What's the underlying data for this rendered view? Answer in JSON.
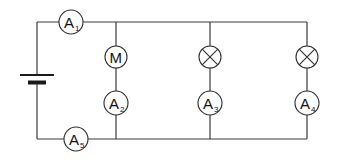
{
  "diagram": {
    "colors": {
      "wire": "#3a3a3a",
      "symbol": "#2e2e2e",
      "background": "#ffffff"
    },
    "battery": {
      "label": "battery",
      "x": 37,
      "long_plate_y": 75,
      "short_plate_y": 82
    },
    "components": {
      "A1": {
        "type": "ammeter",
        "letter": "A",
        "sub": "1",
        "cx": 71,
        "cy": 22
      },
      "M": {
        "type": "motor",
        "letter": "M",
        "cx": 116,
        "cy": 57
      },
      "A2": {
        "type": "ammeter",
        "letter": "A",
        "sub": "2",
        "cx": 116,
        "cy": 103
      },
      "L1": {
        "type": "lamp",
        "cx": 210,
        "cy": 57
      },
      "A3": {
        "type": "ammeter",
        "letter": "A",
        "sub": "3",
        "cx": 210,
        "cy": 103
      },
      "L2": {
        "type": "lamp",
        "cx": 307,
        "cy": 57
      },
      "A4": {
        "type": "ammeter",
        "letter": "A",
        "sub": "4",
        "cx": 307,
        "cy": 103
      },
      "A5": {
        "type": "ammeter",
        "letter": "A",
        "sub": "5",
        "cx": 76,
        "cy": 139
      }
    },
    "branches": [
      {
        "name": "motor-branch",
        "components": [
          "M",
          "A2"
        ]
      },
      {
        "name": "lamp-branch-1",
        "components": [
          "L1",
          "A3"
        ]
      },
      {
        "name": "lamp-branch-2",
        "components": [
          "L2",
          "A4"
        ]
      }
    ]
  }
}
